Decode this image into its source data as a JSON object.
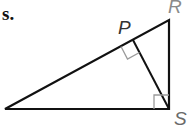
{
  "problem": {
    "number_label": "s."
  },
  "diagram": {
    "type": "right triangle with altitude",
    "vertices": {
      "R": {
        "label": "R",
        "x": 169,
        "y": 20,
        "label_color": "#8a8a8a"
      },
      "S": {
        "label": "S",
        "x": 169,
        "y": 109,
        "label_color": "#6a6a6a"
      },
      "P": {
        "label": "P",
        "x": 133,
        "y": 40,
        "label_color": "#333333"
      },
      "T": {
        "label": "",
        "x": 5,
        "y": 109
      }
    },
    "right_angles": [
      "P",
      "S"
    ],
    "segments": [
      "TR",
      "RS",
      "ST",
      "SP"
    ],
    "line_color": "#111111",
    "marker_color": "#9a9a9a"
  }
}
